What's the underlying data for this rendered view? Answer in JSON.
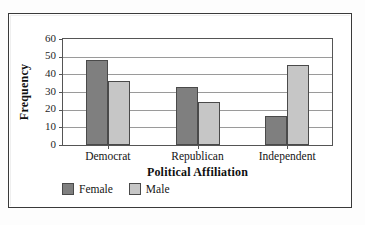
{
  "chart_data": {
    "type": "bar",
    "title": "",
    "xlabel": "Political Affiliation",
    "ylabel": "Frequency",
    "categories": [
      "Democrat",
      "Republican",
      "Independent"
    ],
    "series": [
      {
        "name": "Female",
        "color": "#7f7f7f",
        "values": [
          48,
          33,
          16.5
        ]
      },
      {
        "name": "Male",
        "color": "#c6c6c6",
        "values": [
          36,
          24.5,
          45.5
        ]
      }
    ],
    "ylim": [
      0,
      60
    ],
    "ytick_step": 10,
    "ytick_labels": [
      "60",
      "50",
      "40",
      "30",
      "20",
      "10",
      "0"
    ],
    "grid": "horizontal",
    "legend_position": "bottom-left",
    "border_color": "#3a3a3a",
    "gridline_color": "#9a9a9a",
    "axis_color": "#555555"
  }
}
